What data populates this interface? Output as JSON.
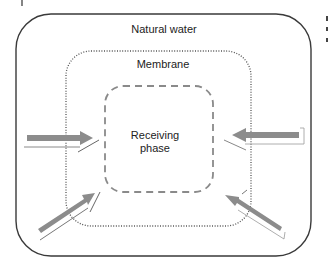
{
  "diagram": {
    "regions": [
      {
        "id": "outer",
        "label": "Natural water",
        "style": "solid"
      },
      {
        "id": "middle",
        "label": "Membrane",
        "style": "dotted"
      },
      {
        "id": "inner",
        "label_line1": "Receiving",
        "label_line2": "phase",
        "style": "dashed"
      }
    ],
    "arrows": [
      {
        "id": "arrow-left",
        "direction": "right"
      },
      {
        "id": "arrow-right",
        "direction": "left"
      },
      {
        "id": "arrow-bottom-left",
        "direction": "up-right"
      },
      {
        "id": "arrow-bottom-right",
        "direction": "up-left"
      }
    ],
    "colors": {
      "outer_stroke": "#3a3a3a",
      "membrane_stroke": "#555555",
      "inner_stroke": "#8a8a8a",
      "arrow_fill": "#8c8c8c",
      "text": "#222222"
    },
    "corner_marks": {
      "top_left": "|",
      "top_right_lines": [
        "I",
        "c",
        "s"
      ]
    }
  }
}
